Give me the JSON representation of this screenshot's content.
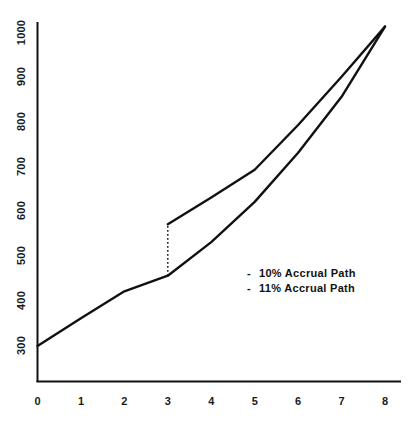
{
  "chart_data": {
    "type": "line",
    "title": "",
    "xlabel": "",
    "ylabel": "",
    "xlim": [
      0,
      8
    ],
    "ylim": [
      250,
      1035
    ],
    "grid": false,
    "legend_position": "inside-right-lower",
    "x_ticks": [
      "0",
      "1",
      "2",
      "3",
      "4",
      "5",
      "6",
      "7",
      "8"
    ],
    "y_ticks": [
      "300",
      "400",
      "500",
      "600",
      "700",
      "800",
      "900",
      "1000"
    ],
    "series": [
      {
        "name": "- 10% Accrual Path",
        "dash_marker": "-",
        "label": "10% Accrual Path",
        "style": "solid",
        "color": "#111111",
        "x": [
          0,
          1,
          2,
          3,
          4,
          5,
          6,
          7,
          8
        ],
        "values": [
          298,
          360,
          420,
          455,
          530,
          620,
          730,
          855,
          1012
        ]
      },
      {
        "name": "- 11% Accrual Path",
        "dash_marker": "-",
        "label": "11% Accrual Path",
        "style": "solid",
        "color": "#111111",
        "x": [
          3,
          4,
          5,
          6,
          7,
          8
        ],
        "values": [
          570,
          630,
          692,
          792,
          900,
          1012
        ]
      }
    ],
    "annotations": [
      {
        "name": "step-up-connector",
        "style": "dotted",
        "x": 3,
        "y_from": 455,
        "y_to": 570
      }
    ]
  },
  "axes": {
    "y_tick_labels": [
      "1000",
      "900",
      "800",
      "700",
      "600",
      "500",
      "400",
      "300"
    ],
    "x_tick_labels": [
      "0",
      "1",
      "2",
      "3",
      "4",
      "5",
      "6",
      "7",
      "8"
    ]
  },
  "legend": {
    "entries": [
      {
        "marker": "-",
        "label": "10% Accrual Path"
      },
      {
        "marker": "-",
        "label": "11% Accrual Path"
      }
    ]
  }
}
